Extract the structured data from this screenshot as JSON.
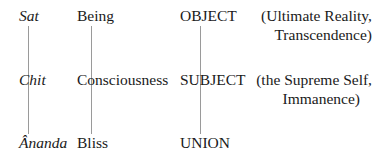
{
  "rows": [
    {
      "sanskrit": "Sat",
      "english": "Being",
      "category": "OBJECT",
      "gloss_line1": "(Ultimate Reality,",
      "gloss_line2": "Transcendence)"
    },
    {
      "sanskrit": "Chit",
      "english": "Consciousness",
      "category": "SUBJECT",
      "gloss_line1": "(the Supreme Self,",
      "gloss_line2": "Immanence)"
    },
    {
      "sanskrit": "Ânanda",
      "english": "Bliss",
      "category": "UNION"
    }
  ],
  "colors": {
    "text": "#1a1a1a",
    "line": "#9a9a9a"
  }
}
